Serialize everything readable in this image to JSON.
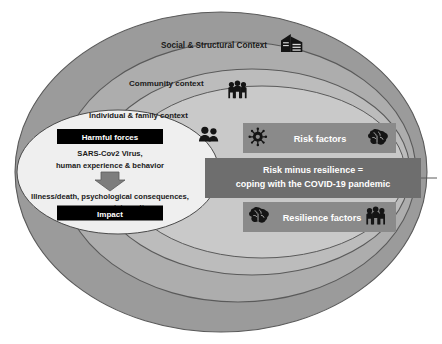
{
  "diagram": {
    "type": "nested-ellipse-concentric-diagram",
    "background_color": "#ffffff",
    "rings": [
      {
        "id": "social-structural",
        "label": "Social & Structural Context",
        "fill": "#9b9b9b",
        "stroke": "#5a5a5a",
        "icon": "office-building-icon"
      },
      {
        "id": "community",
        "label": "Community context",
        "fill": "#adadad",
        "stroke": "#5a5a5a",
        "icon": "three-people-group-icon"
      },
      {
        "id": "individual-family",
        "label": "Individual & family context",
        "fill": "#c4c4c4",
        "stroke": "#5a5a5a",
        "icon": "two-people-icon"
      },
      {
        "id": "core",
        "label": "",
        "fill": "#eeeeee",
        "stroke": "#4a4a4a",
        "icon": ""
      }
    ],
    "core": {
      "harmful_forces_label": "Harmful forces",
      "harmful_forces_lines": [
        "SARS-Cov2 Virus,",
        "human experience & behavior"
      ],
      "arrow_icon": "down-arrow-icon",
      "impact_lines": [
        "Illness/death, psychological consequences,",
        "economy, society, culture"
      ],
      "impact_label": "Impact",
      "box_fill": "#000000",
      "box_text_color": "#ffffff"
    },
    "boxes": [
      {
        "id": "risk-factors",
        "label": "Risk factors",
        "fill": "#8a8a8a",
        "icon_left": "virus-icon",
        "icon_right": "brain-icon"
      },
      {
        "id": "resilience-factors",
        "label": "Resilience factors",
        "fill": "#8a8a8a",
        "icon_left": "brain-icon",
        "icon_right": "three-people-group-icon"
      }
    ],
    "center_box": {
      "id": "risk-minus-resilience",
      "line1": "Risk minus resilience =",
      "line2": "coping with the COVID-19 pandemic",
      "fill": "#6e6e6e"
    }
  }
}
